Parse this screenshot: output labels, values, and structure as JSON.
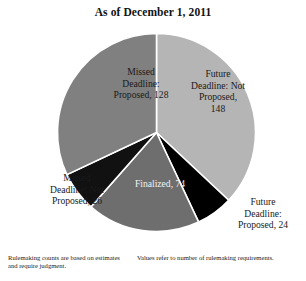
{
  "chart_data": {
    "type": "pie",
    "title": "As of December 1, 2011",
    "total": 400,
    "legend_position": "inside-slices",
    "categories": [
      "Future Deadline: Not Proposed",
      "Future Deadline: Proposed",
      "Finalized",
      "Missed Deadline: Not Proposed",
      "Missed Deadline: Proposed"
    ],
    "values": [
      148,
      24,
      74,
      26,
      128
    ],
    "slices": [
      {
        "name": "future-deadline-not-proposed",
        "label": "Future\nDeadline: Not\nProposed,\n148",
        "value": 148,
        "color": "#b5b5b5",
        "start_angle": 0,
        "end_angle": 133.2,
        "label_color": "dark"
      },
      {
        "name": "future-deadline-proposed",
        "label": "Future\nDeadline:\nProposed, 24",
        "value": 24,
        "color": "#000000",
        "start_angle": 133.2,
        "end_angle": 154.8,
        "label_color": "dark"
      },
      {
        "name": "finalized",
        "label": "Finalized, 74",
        "value": 74,
        "color": "#6e6e6e",
        "start_angle": 154.8,
        "end_angle": 221.4,
        "label_color": "light"
      },
      {
        "name": "missed-deadline-not-proposed",
        "label": "Missed\nDeadline: Not\nProposed, 26",
        "value": 26,
        "color": "#111111",
        "start_angle": 221.4,
        "end_angle": 244.8,
        "label_color": "dark"
      },
      {
        "name": "missed-deadline-proposed",
        "label": "Missed\nDeadline:\nProposed, 128",
        "value": 128,
        "color": "#808080",
        "start_angle": 244.8,
        "end_angle": 360,
        "label_color": "dark"
      }
    ],
    "xlabel": "",
    "ylabel": "",
    "grid": false
  },
  "footnotes": {
    "left": "Rulemaking counts are based on estimates and require judgment.",
    "right": "Values refer to number of rulemaking requirements."
  }
}
